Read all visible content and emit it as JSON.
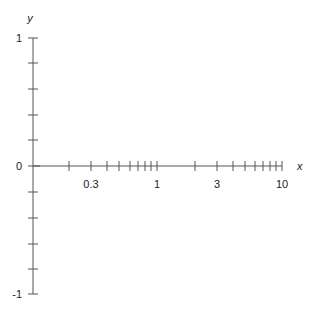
{
  "chart_data": {
    "type": "line",
    "title": "",
    "xlabel": "x",
    "ylabel": "y",
    "x_scale": "log",
    "xlim": [
      0.1,
      10
    ],
    "ylim": [
      -1,
      1
    ],
    "grid": false,
    "x_tick_labels": [
      "0.3",
      "1",
      "3",
      "10"
    ],
    "x_tick_label_values": [
      0.3,
      1,
      3,
      10
    ],
    "x_minor_ticks": [
      0.2,
      0.3,
      0.4,
      0.5,
      0.6,
      0.7,
      0.8,
      0.9,
      1,
      2,
      3,
      4,
      5,
      6,
      7,
      8,
      9,
      10
    ],
    "y_tick_labels": [
      "1",
      "0",
      "-1"
    ],
    "y_tick_label_values": [
      1,
      0,
      -1
    ],
    "y_minor_ticks": [
      1,
      0.8,
      0.6,
      0.4,
      0.2,
      0,
      -0.2,
      -0.4,
      -0.6,
      -0.8,
      -1
    ],
    "series": []
  },
  "axes": {
    "x_label": "x",
    "y_label": "y",
    "x_ticks": [
      {
        "px": 69,
        "label": ""
      },
      {
        "px": 91,
        "label": "0.3"
      },
      {
        "px": 107,
        "label": ""
      },
      {
        "px": 119,
        "label": ""
      },
      {
        "px": 130,
        "label": ""
      },
      {
        "px": 138,
        "label": ""
      },
      {
        "px": 145,
        "label": ""
      },
      {
        "px": 151,
        "label": ""
      },
      {
        "px": 157,
        "label": "1"
      },
      {
        "px": 195,
        "label": ""
      },
      {
        "px": 217,
        "label": "3"
      },
      {
        "px": 233,
        "label": ""
      },
      {
        "px": 245,
        "label": ""
      },
      {
        "px": 255,
        "label": ""
      },
      {
        "px": 263,
        "label": ""
      },
      {
        "px": 270,
        "label": ""
      },
      {
        "px": 276,
        "label": ""
      },
      {
        "px": 282,
        "label": "10"
      }
    ],
    "y_ticks": [
      {
        "py": 38,
        "label": "1"
      },
      {
        "py": 63,
        "label": ""
      },
      {
        "py": 89,
        "label": ""
      },
      {
        "py": 115,
        "label": ""
      },
      {
        "py": 140,
        "label": ""
      },
      {
        "py": 166,
        "label": "0"
      },
      {
        "py": 192,
        "label": ""
      },
      {
        "py": 218,
        "label": ""
      },
      {
        "py": 244,
        "label": ""
      },
      {
        "py": 269,
        "label": ""
      },
      {
        "py": 294,
        "label": "-1"
      }
    ]
  }
}
